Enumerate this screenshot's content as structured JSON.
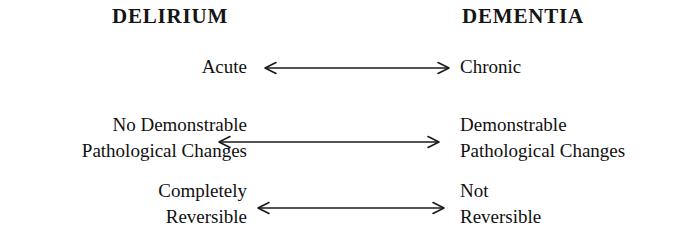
{
  "diagram": {
    "columns": {
      "left_header": "DELIRIUM",
      "right_header": "DEMENTIA"
    },
    "rows": [
      {
        "id": "onset",
        "left": [
          "Acute"
        ],
        "right": [
          "Chronic"
        ],
        "connector": "double-headed-arrow"
      },
      {
        "id": "pathology",
        "left": [
          "No Demonstrable",
          "Pathological Changes"
        ],
        "right": [
          "Demonstrable",
          "Pathological Changes"
        ],
        "connector": "double-headed-arrow"
      },
      {
        "id": "reversibility",
        "left": [
          "Completely",
          "Reversible"
        ],
        "right": [
          "Not",
          "Reversible"
        ],
        "connector": "double-headed-arrow"
      }
    ],
    "colors": {
      "background": "#ffffff",
      "text": "#111111",
      "arrow": "#1a1a1a"
    }
  }
}
